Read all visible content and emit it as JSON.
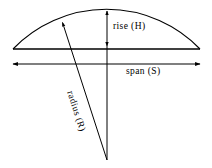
{
  "figure": {
    "type": "geometry-diagram",
    "background_color": "#ffffff",
    "stroke_color": "#000000",
    "width": 212,
    "height": 168,
    "labels": {
      "rise": "rise (H)",
      "span": "span (S)",
      "radius": "radius (R)"
    },
    "geometry": {
      "arc": {
        "left_end": [
          13,
          49
        ],
        "right_end": [
          200,
          49
        ],
        "apex": [
          105,
          11
        ],
        "sagitta_px": 38
      },
      "chord": {
        "from": [
          13,
          49
        ],
        "to": [
          200,
          49
        ],
        "style": "solid"
      },
      "span_dimension": {
        "from": [
          13,
          64
        ],
        "to": [
          200,
          64
        ],
        "arrowheads": "both",
        "length_px": 187
      },
      "rise_dimension": {
        "from": [
          107,
          11
        ],
        "to": [
          107,
          46
        ],
        "arrowheads": "both",
        "length_px": 35
      },
      "radius_line": {
        "from": [
          107,
          160
        ],
        "to": [
          62,
          22
        ],
        "arrowheads": "end",
        "note": "drawn from circle centre up-left to the arc"
      },
      "centre_line": {
        "from": [
          107,
          46
        ],
        "to": [
          107,
          160
        ],
        "style": "solid"
      },
      "centre_point": [
        107,
        160
      ]
    }
  }
}
